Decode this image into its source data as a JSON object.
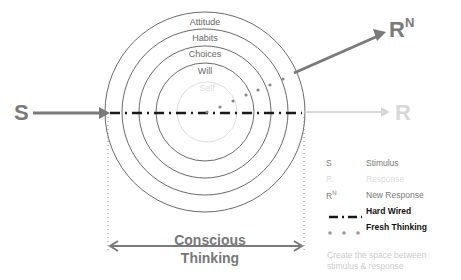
{
  "diagram": {
    "stimulus_label": "S",
    "response_label": "R",
    "new_response_label": "R",
    "new_response_superscript": "N",
    "rings": [
      {
        "label": "Attitude"
      },
      {
        "label": "Habits"
      },
      {
        "label": "Choices"
      },
      {
        "label": "Will"
      },
      {
        "label": "Self"
      }
    ],
    "conscious_thinking": {
      "line1": "Conscious",
      "line2": "Thinking"
    }
  },
  "legend": {
    "items": [
      {
        "key": "S",
        "label": "Stimulus"
      },
      {
        "key": "R",
        "label": "Response"
      },
      {
        "key": "R",
        "key_sup": "N",
        "label": "New Response"
      },
      {
        "key": "hard-wired-line",
        "label": "Hard Wired"
      },
      {
        "key": "fresh-thinking-dots",
        "label": "Fresh Thinking"
      }
    ],
    "note_line1": "Create the space between",
    "note_line2": "stimulus & response"
  },
  "colors": {
    "arrow_gray": "#7a7a7a",
    "response_light": "#d8d8d8",
    "ring_stroke": "#6a6a6a",
    "self_ring": "#dddddd",
    "hard_wired": "#1a1a1a"
  }
}
